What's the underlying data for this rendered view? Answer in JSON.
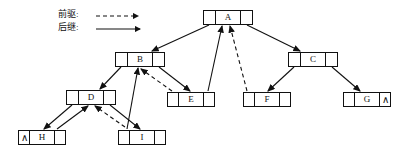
{
  "diagram": {
    "type": "linked-tree-diagram",
    "colors": {
      "stroke": "#111111",
      "background": "#ffffff",
      "node_fill": "#ffffff"
    }
  },
  "legend": {
    "rows": [
      {
        "label": "前驱:",
        "style": "dashed",
        "icon": "dashed-arrow-icon"
      },
      {
        "label": "后继:",
        "style": "solid",
        "icon": "solid-arrow-icon"
      }
    ]
  },
  "nodes": [
    {
      "id": "A",
      "key": "A",
      "x": 203,
      "y": 10,
      "w": 50,
      "left_null": false,
      "right_null": false
    },
    {
      "id": "B",
      "key": "B",
      "x": 115,
      "y": 52,
      "w": 50,
      "left_null": false,
      "right_null": false
    },
    {
      "id": "C",
      "key": "C",
      "x": 288,
      "y": 52,
      "w": 50,
      "left_null": false,
      "right_null": false
    },
    {
      "id": "D",
      "key": "D",
      "x": 66,
      "y": 90,
      "w": 50,
      "left_null": false,
      "right_null": false
    },
    {
      "id": "E",
      "key": "E",
      "x": 167,
      "y": 92,
      "w": 48,
      "left_null": false,
      "right_null": false
    },
    {
      "id": "F",
      "key": "F",
      "x": 243,
      "y": 92,
      "w": 48,
      "left_null": false,
      "right_null": false
    },
    {
      "id": "G",
      "key": "G",
      "x": 343,
      "y": 92,
      "w": 48,
      "left_null": false,
      "right_null": true
    },
    {
      "id": "H",
      "key": "H",
      "x": 18,
      "y": 130,
      "w": 48,
      "left_null": true,
      "right_null": false
    },
    {
      "id": "I",
      "key": "I",
      "x": 118,
      "y": 130,
      "w": 48,
      "left_null": false,
      "right_null": false
    }
  ],
  "edges": [
    {
      "name": "A-left-to-B",
      "style": "solid",
      "x1": 209,
      "y1": 25,
      "x2": 152,
      "y2": 51
    },
    {
      "name": "A-right-to-C",
      "style": "solid",
      "x1": 247,
      "y1": 25,
      "x2": 300,
      "y2": 51
    },
    {
      "name": "B-left-to-D",
      "style": "solid",
      "x1": 121,
      "y1": 67,
      "x2": 100,
      "y2": 89
    },
    {
      "name": "B-right-to-E",
      "style": "solid",
      "x1": 159,
      "y1": 67,
      "x2": 190,
      "y2": 91
    },
    {
      "name": "C-left-to-F",
      "style": "solid",
      "x1": 294,
      "y1": 67,
      "x2": 268,
      "y2": 91
    },
    {
      "name": "C-right-to-G",
      "style": "solid",
      "x1": 332,
      "y1": 67,
      "x2": 360,
      "y2": 91
    },
    {
      "name": "D-left-to-H",
      "style": "solid",
      "x1": 72,
      "y1": 105,
      "x2": 44,
      "y2": 129
    },
    {
      "name": "D-right-to-I",
      "style": "solid",
      "x1": 110,
      "y1": 105,
      "x2": 140,
      "y2": 129
    },
    {
      "name": "E-succ-to-A",
      "style": "solid",
      "x1": 208,
      "y1": 91,
      "x2": 222,
      "y2": 26
    },
    {
      "name": "I-succ-to-B",
      "style": "solid",
      "x1": 127,
      "y1": 129,
      "x2": 138,
      "y2": 68
    },
    {
      "name": "H-succ-to-D",
      "style": "solid",
      "x1": 57,
      "y1": 129,
      "x2": 88,
      "y2": 106
    },
    {
      "name": "A-pred-to-F",
      "style": "dashed",
      "x1": 247,
      "y1": 91,
      "x2": 230,
      "y2": 26
    },
    {
      "name": "B-pred-to-E",
      "style": "dashed",
      "x1": 172,
      "y1": 91,
      "x2": 141,
      "y2": 69
    },
    {
      "name": "D-pred-to-I",
      "style": "dashed",
      "x1": 125,
      "y1": 127,
      "x2": 95,
      "y2": 106
    }
  ],
  "glyphs": {
    "null_mark": "∧",
    "slash": "∕"
  }
}
